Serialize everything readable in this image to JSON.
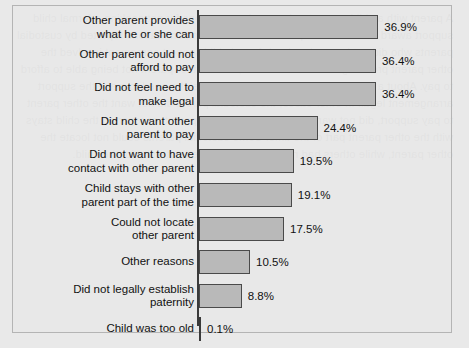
{
  "chart_data": {
    "type": "bar",
    "orientation": "horizontal",
    "title": "",
    "xlabel": "",
    "ylabel": "",
    "xlim": [
      0,
      40
    ],
    "grid": false,
    "legend": null,
    "value_suffix": "%",
    "categories": [
      "Other parent provides\nwhat he or she can",
      "Other parent could not\nafford to pay",
      "Did not feel need to\nmake legal",
      "Did not want other\nparent to pay",
      "Did not want to have\ncontact with other parent",
      "Child stays with other\nparent part of the time",
      "Could not locate\nother parent",
      "Other reasons",
      "Did not legally establish\npaternity",
      "Child was too old"
    ],
    "values": [
      36.9,
      36.4,
      36.4,
      24.4,
      19.5,
      19.1,
      17.5,
      10.5,
      8.8,
      0.1
    ],
    "value_labels": [
      "36.9%",
      "36.4%",
      "36.4%",
      "24.4%",
      "19.5%",
      "19.1%",
      "17.5%",
      "10.5%",
      "8.8%",
      "0.1%"
    ],
    "colors": {
      "bar_fill": "#b9b9b9",
      "bar_border": "#4a4a4a",
      "axis": "#3a3a3a",
      "background": "#e9e9e9",
      "frame_border": "#b4b4b4",
      "text": "#111111"
    }
  },
  "bleed_text": "A parent with a child support order may have reasons for not seeking a formal child support award from the other parent. The most common reasons reported by custodial parents who did not have a legal or informal child support agreement involved the other parent providing what he or she can, or the other parent not being able to afford to pay. About a third of custodial parents did not feel the need to make the support arrangement legal. In other cases, the custodial parent did not want the other parent to pay support, did not want contact with the other parent, or reported the child stays with the other parent part of the time. Some custodial parents could not locate the other parent, while others had not legally established paternity for the child."
}
